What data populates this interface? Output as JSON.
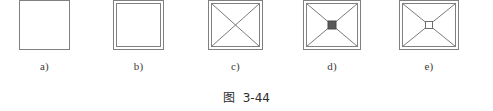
{
  "figure": {
    "caption_prefix": "图",
    "caption_number": "3-44",
    "caption_full": "图  3-44",
    "stroke_color": "#808080",
    "accent_color": "#595959",
    "background_color": "#ffffff",
    "panels": [
      {
        "id": "a",
        "label": "a)",
        "description": "single square outline",
        "x": 19,
        "y": 8,
        "width": 51,
        "height": 50,
        "double_border": false,
        "diagonals": false,
        "center_marker": "none"
      },
      {
        "id": "b",
        "label": "b)",
        "description": "square with nested inner square",
        "x": 113,
        "y": 8,
        "width": 51,
        "height": 50,
        "double_border": true,
        "diagonals": false,
        "center_marker": "none"
      },
      {
        "id": "c",
        "label": "c)",
        "description": "double square with diagonal cross",
        "x": 208,
        "y": 8,
        "width": 55,
        "height": 50,
        "double_border": true,
        "diagonals": true,
        "center_marker": "none"
      },
      {
        "id": "d",
        "label": "d)",
        "description": "double square with diagonal cross and filled center square",
        "x": 303,
        "y": 8,
        "width": 58,
        "height": 50,
        "double_border": true,
        "diagonals": true,
        "center_marker": "filled-square"
      },
      {
        "id": "e",
        "label": "e)",
        "description": "double square with diagonal cross and hollow center square",
        "x": 399,
        "y": 8,
        "width": 60,
        "height": 50,
        "double_border": true,
        "diagonals": true,
        "center_marker": "hollow-square"
      }
    ]
  }
}
